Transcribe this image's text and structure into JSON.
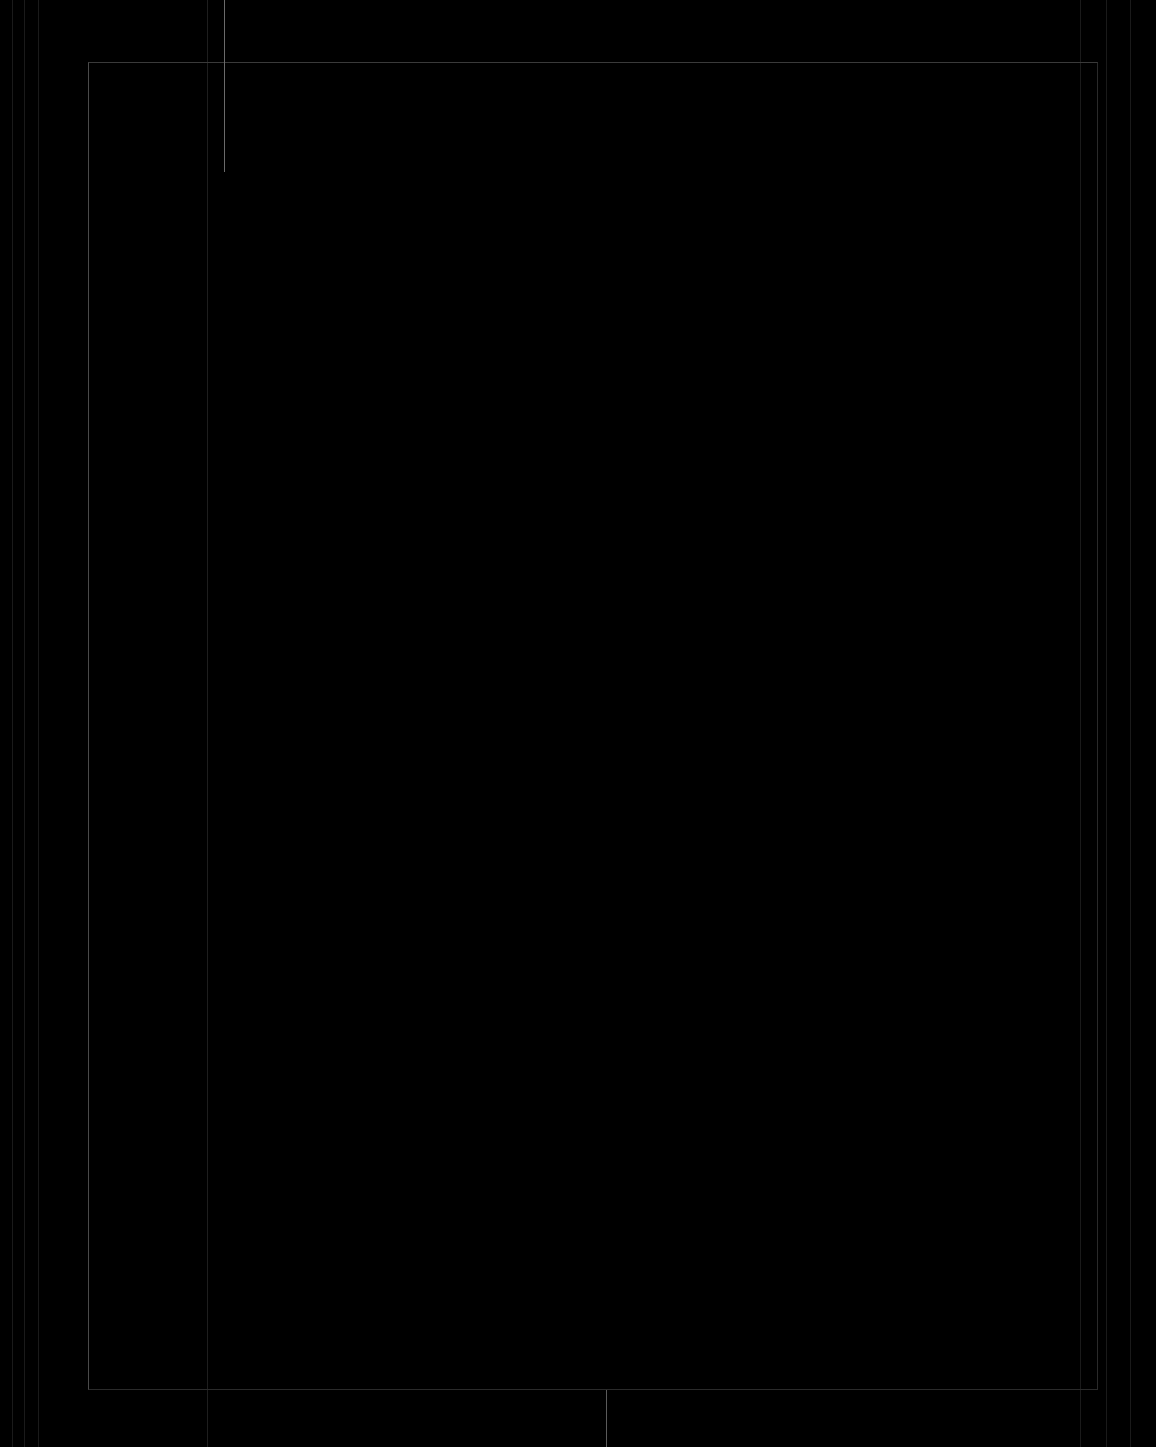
{
  "screen": {
    "background": "#000000",
    "description": "blank dark frame"
  }
}
